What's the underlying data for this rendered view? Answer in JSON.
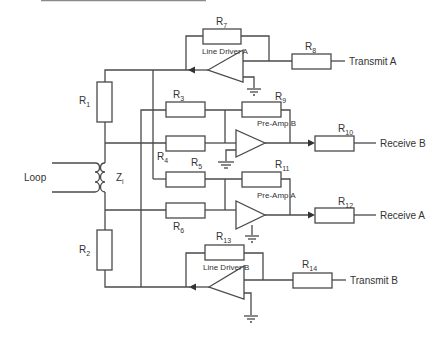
{
  "diagram": {
    "header_rule_color": "#8a8a8a",
    "wire_color": "#4a4a4a",
    "resistors": [
      {
        "id": "R1",
        "letter": "R",
        "sub": "1"
      },
      {
        "id": "R2",
        "letter": "R",
        "sub": "2"
      },
      {
        "id": "R3",
        "letter": "R",
        "sub": "3"
      },
      {
        "id": "R4",
        "letter": "R",
        "sub": "4"
      },
      {
        "id": "R5",
        "letter": "R",
        "sub": "5"
      },
      {
        "id": "R6",
        "letter": "R",
        "sub": "6"
      },
      {
        "id": "R7",
        "letter": "R",
        "sub": "7"
      },
      {
        "id": "R8",
        "letter": "R",
        "sub": "8"
      },
      {
        "id": "R9",
        "letter": "R",
        "sub": "9"
      },
      {
        "id": "R10",
        "letter": "R",
        "sub": "10"
      },
      {
        "id": "R11",
        "letter": "R",
        "sub": "11"
      },
      {
        "id": "R12",
        "letter": "R",
        "sub": "12"
      },
      {
        "id": "R13",
        "letter": "R",
        "sub": "13"
      },
      {
        "id": "R14",
        "letter": "R",
        "sub": "14"
      }
    ],
    "amplifiers": [
      {
        "id": "line-driver-a",
        "label": "Line Driver A"
      },
      {
        "id": "pre-amp-b",
        "label": "Pre-Amp B"
      },
      {
        "id": "pre-amp-a",
        "label": "Pre-Amp A"
      },
      {
        "id": "line-driver-b",
        "label": "Line Driver B"
      }
    ],
    "transformer": {
      "label_letter": "Z",
      "label_sub": "i"
    },
    "terminals": {
      "loop": "Loop",
      "transmit_a": "Transmit A",
      "receive_b": "Receive B",
      "receive_a": "Receive A",
      "transmit_b": "Transmit B"
    }
  }
}
